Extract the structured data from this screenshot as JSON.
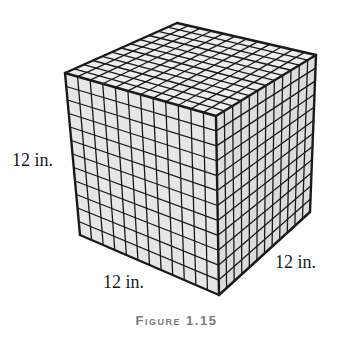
{
  "figure": {
    "caption": "Figure 1.15",
    "grid_divisions": 12,
    "labels": {
      "height": "12 in.",
      "width": "12 in.",
      "depth": "12 in."
    },
    "colors": {
      "face_front": "#e6e6e6",
      "face_right": "#dcdcdc",
      "face_top": "#eeeeee",
      "grid_line": "#1a1a1a",
      "caption": "#7a7a7a"
    },
    "vertices": {
      "top_back": [
        177,
        23
      ],
      "top_left": [
        65,
        73
      ],
      "top_front": [
        216,
        116
      ],
      "top_right": [
        316,
        55
      ],
      "bottom_left": [
        80,
        235
      ],
      "bottom_front": [
        219,
        295
      ],
      "bottom_right": [
        310,
        212
      ]
    }
  }
}
